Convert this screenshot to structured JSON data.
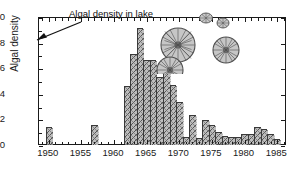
{
  "chart_data": {
    "type": "bar",
    "title": "",
    "xlabel": "",
    "ylabel": "Algal density",
    "xlim": [
      1948.5,
      1986.5
    ],
    "ylim": [
      0,
      10
    ],
    "ytick_labels": [
      "0",
      "2",
      "4",
      "6",
      "8",
      "10"
    ],
    "ytick_values": [
      0,
      2,
      4,
      6,
      8,
      10
    ],
    "xtick_labels": [
      "1950",
      "1955",
      "1960",
      "1965",
      "1970",
      "1975",
      "1980",
      "1985"
    ],
    "xtick_values": [
      1950,
      1955,
      1960,
      1965,
      1970,
      1975,
      1980,
      1985
    ],
    "grid": false,
    "legend": false,
    "bar_fill": "#b9b9b9",
    "bar_edge": "#3a3a3a",
    "categories": [
      1950,
      1951,
      1952,
      1953,
      1954,
      1955,
      1956,
      1957,
      1958,
      1959,
      1960,
      1961,
      1962,
      1963,
      1964,
      1965,
      1966,
      1967,
      1968,
      1969,
      1970,
      1971,
      1972,
      1973,
      1974,
      1975,
      1976,
      1977,
      1978,
      1979,
      1980,
      1981,
      1982,
      1983,
      1984,
      1985
    ],
    "values": [
      1.3,
      0,
      0,
      0,
      0,
      0,
      0,
      1.5,
      0,
      0,
      0,
      0,
      4.5,
      7.0,
      9.1,
      6.6,
      6.6,
      5.2,
      6.0,
      4.6,
      3.3,
      0.55,
      2.3,
      0.45,
      1.9,
      1.5,
      0.9,
      0.6,
      0.55,
      0.55,
      0.8,
      0.75,
      1.3,
      1.2,
      0.8,
      0.4
    ],
    "annotations": [
      {
        "text": "Algal density in lake",
        "points_to": 1965
      }
    ]
  },
  "decorations": {
    "algae_icon_name": "diatom-cells-illustration",
    "arrow_icon_name": "annotation-arrow-icon"
  }
}
